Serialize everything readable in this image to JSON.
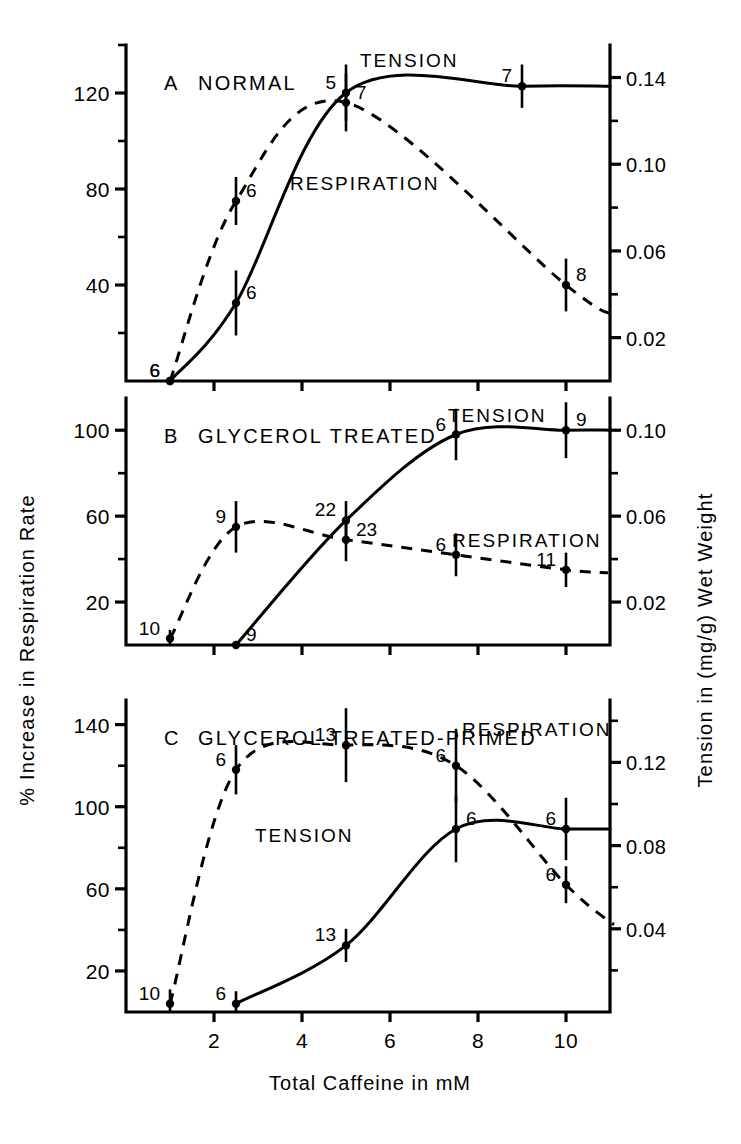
{
  "figure": {
    "xlabel": "Total  Caffeine in mM",
    "ylabel_left": "%  Increase in  Respiration  Rate",
    "ylabel_right": "Tension in (mg/g) Wet Weight",
    "xticks": [
      "2",
      "4",
      "6",
      "8",
      "10"
    ],
    "series_labels": {
      "tension": "TENSION",
      "respiration": "RESPIRATION"
    }
  },
  "chart_data": [
    {
      "type": "line",
      "panel": "A",
      "title": "A   NORMAL",
      "title_letter": "A",
      "title_text": "NORMAL",
      "xlabel": "Total  Caffeine in mM",
      "ylabel": "%  Increase in  Respiration  Rate",
      "ylabel_right": "Tension in (mg/g) Wet Weight",
      "xlim": [
        0,
        11
      ],
      "ylim_left": [
        0,
        140
      ],
      "ylim_right": [
        0,
        0.155
      ],
      "yticks_left": [
        "40",
        "80",
        "120"
      ],
      "yticks_left_values": [
        40,
        80,
        120
      ],
      "yticks_left_minor": [
        20,
        60,
        100,
        140
      ],
      "yticks_right": [
        "0.02",
        "0.06",
        "0.10",
        "0.14"
      ],
      "yticks_right_values": [
        0.02,
        0.06,
        0.1,
        0.14
      ],
      "yticks_right_minor": [
        0.04,
        0.08,
        0.12
      ],
      "grid": false,
      "legend_position": "inline-annotation",
      "series": [
        {
          "name": "TENSION",
          "style": "solid",
          "axis": "right",
          "label_text": "TENSION",
          "points": [
            {
              "x": 1.0,
              "y": 0.0,
              "err": 0.0,
              "n": "6",
              "n_side": "left"
            },
            {
              "x": 2.5,
              "y": 0.036,
              "err": 0.015,
              "n": "6",
              "n_side": "right"
            },
            {
              "x": 5.0,
              "y": 0.133,
              "err": 0.013,
              "n": "5",
              "n_side": "left"
            },
            {
              "x": 9.0,
              "y": 0.136,
              "err": 0.01,
              "n": "7",
              "n_side": "left"
            }
          ]
        },
        {
          "name": "RESPIRATION",
          "style": "dashed",
          "axis": "left",
          "label_text": "RESPIRATION",
          "points": [
            {
              "x": 1.0,
              "y": 0,
              "err": 0,
              "n": "6",
              "n_side": "left"
            },
            {
              "x": 2.5,
              "y": 75,
              "err": 10,
              "n": "6",
              "n_side": "right"
            },
            {
              "x": 5.0,
              "y": 116,
              "err": 12,
              "n": "7",
              "n_side": "right"
            },
            {
              "x": 10.0,
              "y": 40,
              "err": 11,
              "n": "8",
              "n_side": "right"
            }
          ]
        }
      ]
    },
    {
      "type": "line",
      "panel": "B",
      "title": "B  GLYCEROL  TREATED",
      "title_letter": "B",
      "title_text": "GLYCEROL  TREATED",
      "xlim": [
        0,
        11
      ],
      "ylim_left": [
        0,
        115
      ],
      "ylim_right": [
        0,
        0.115
      ],
      "yticks_left": [
        "20",
        "60",
        "100"
      ],
      "yticks_left_values": [
        20,
        60,
        100
      ],
      "yticks_left_minor": [
        40,
        80
      ],
      "yticks_right": [
        "0.02",
        "0.06",
        "0.10"
      ],
      "yticks_right_values": [
        0.02,
        0.06,
        0.1
      ],
      "yticks_right_minor": [
        0.04,
        0.08
      ],
      "grid": false,
      "series": [
        {
          "name": "TENSION",
          "style": "solid",
          "axis": "right",
          "label_text": "TENSION",
          "points": [
            {
              "x": 2.5,
              "y": 0.0,
              "err": 0.0,
              "n": "9",
              "n_side": "right"
            },
            {
              "x": 5.0,
              "y": 0.058,
              "err": 0.009,
              "n": "22",
              "n_side": "left"
            },
            {
              "x": 7.5,
              "y": 0.098,
              "err": 0.012,
              "n": "6",
              "n_side": "left"
            },
            {
              "x": 10.0,
              "y": 0.1,
              "err": 0.013,
              "n": "9",
              "n_side": "right"
            }
          ]
        },
        {
          "name": "RESPIRATION",
          "style": "dashed",
          "axis": "left",
          "label_text": "RESPIRATION",
          "points": [
            {
              "x": 1.0,
              "y": 3,
              "err": 4,
              "n": "10",
              "n_side": "left"
            },
            {
              "x": 2.5,
              "y": 55,
              "err": 12,
              "n": "9",
              "n_side": "left"
            },
            {
              "x": 5.0,
              "y": 49,
              "err": 10,
              "n": "23",
              "n_side": "right"
            },
            {
              "x": 7.5,
              "y": 42,
              "err": 10,
              "n": "6",
              "n_side": "left"
            },
            {
              "x": 10.0,
              "y": 35,
              "err": 8,
              "n": "11",
              "n_side": "left"
            }
          ]
        }
      ]
    },
    {
      "type": "line",
      "panel": "C",
      "title": "C  GLYCEROL  TREATED-PRIMED",
      "title_letter": "C",
      "title_text": "GLYCEROL  TREATED-PRIMED",
      "xlim": [
        0,
        11
      ],
      "ylim_left": [
        0,
        152
      ],
      "ylim_right": [
        0,
        0.15
      ],
      "yticks_left": [
        "20",
        "60",
        "100",
        "140"
      ],
      "yticks_left_values": [
        20,
        60,
        100,
        140
      ],
      "yticks_left_minor": [
        40,
        80,
        120
      ],
      "yticks_right": [
        "0.04",
        "0.08",
        "0.12"
      ],
      "yticks_right_values": [
        0.04,
        0.08,
        0.12
      ],
      "yticks_right_minor": [
        0.02,
        0.06,
        0.1,
        0.14
      ],
      "grid": false,
      "series": [
        {
          "name": "TENSION",
          "style": "solid",
          "axis": "right",
          "label_text": "TENSION",
          "points": [
            {
              "x": 2.5,
              "y": 0.004,
              "err": 0.006,
              "n": "6",
              "n_side": "left"
            },
            {
              "x": 5.0,
              "y": 0.032,
              "err": 0.008,
              "n": "13",
              "n_side": "left"
            },
            {
              "x": 7.5,
              "y": 0.088,
              "err": 0.016,
              "n": "6",
              "n_side": "right"
            },
            {
              "x": 10.0,
              "y": 0.088,
              "err": 0.015,
              "n": "6",
              "n_side": "left"
            }
          ]
        },
        {
          "name": "RESPIRATION",
          "style": "dashed",
          "axis": "left",
          "label_text": "RESPIRATION",
          "points": [
            {
              "x": 1.0,
              "y": 4,
              "err": 7,
              "n": "10",
              "n_side": "left"
            },
            {
              "x": 2.5,
              "y": 118,
              "err": 12,
              "n": "6",
              "n_side": "left"
            },
            {
              "x": 5.0,
              "y": 130,
              "err": 18,
              "n": "13",
              "n_side": "left"
            },
            {
              "x": 7.5,
              "y": 120,
              "err": 18,
              "n": "6",
              "n_side": "left"
            },
            {
              "x": 10.0,
              "y": 62,
              "err": 9,
              "n": "6",
              "n_side": "left"
            }
          ]
        }
      ]
    }
  ]
}
